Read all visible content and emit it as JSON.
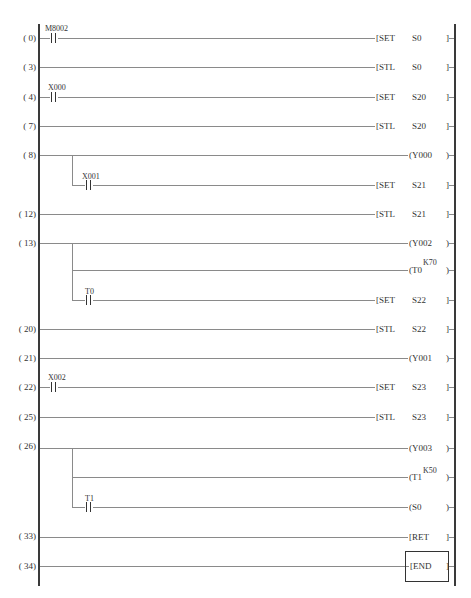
{
  "diagram": {
    "type": "PLC ladder diagram (SFC step ladder)",
    "rungs": [
      {
        "step": "( 0)",
        "contact": "M8002",
        "instr": "[SET",
        "operand": "S0",
        "close": "]"
      },
      {
        "step": "( 3)",
        "contact": null,
        "instr": "[STL",
        "operand": "S0",
        "close": "]"
      },
      {
        "step": "( 4)",
        "contact": "X000",
        "instr": "[SET",
        "operand": "S20",
        "close": "]"
      },
      {
        "step": "( 7)",
        "contact": null,
        "instr": "[STL",
        "operand": "S20",
        "close": "]"
      },
      {
        "step": "( 8)",
        "contact": null,
        "coil": "(Y000",
        "close": ")"
      },
      {
        "step": "",
        "branch_contact": "X001",
        "instr": "[SET",
        "operand": "S21",
        "close": "]"
      },
      {
        "step": "( 12)",
        "contact": null,
        "instr": "[STL",
        "operand": "S21",
        "close": "]"
      },
      {
        "step": "( 13)",
        "contact": null,
        "coil": "(Y002",
        "close": ")"
      },
      {
        "step": "",
        "branch": true,
        "coil": "(T0",
        "preset": "K70",
        "close": ")"
      },
      {
        "step": "",
        "branch_contact": "T0",
        "instr": "[SET",
        "operand": "S22",
        "close": "]"
      },
      {
        "step": "( 20)",
        "contact": null,
        "instr": "[STL",
        "operand": "S22",
        "close": "]"
      },
      {
        "step": "( 21)",
        "contact": null,
        "coil": "(Y001",
        "close": ")"
      },
      {
        "step": "( 22)",
        "contact": "X002",
        "instr": "[SET",
        "operand": "S23",
        "close": "]"
      },
      {
        "step": "( 25)",
        "contact": null,
        "instr": "[STL",
        "operand": "S23",
        "close": "]"
      },
      {
        "step": "( 26)",
        "contact": null,
        "coil": "(Y003",
        "close": ")"
      },
      {
        "step": "",
        "branch": true,
        "coil": "(T1",
        "preset": "K50",
        "close": ")"
      },
      {
        "step": "",
        "branch_contact": "T1",
        "coil": "(S0",
        "close": ")"
      },
      {
        "step": "( 33)",
        "contact": null,
        "coil": "[RET",
        "close": "]"
      },
      {
        "step": "( 34)",
        "contact": null,
        "coil": "[END",
        "close": "]",
        "boxed": true
      }
    ]
  }
}
